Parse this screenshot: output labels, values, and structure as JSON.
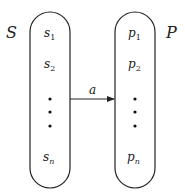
{
  "diagram": {
    "left_set": {
      "label": "S",
      "items": [
        {
          "base": "s",
          "sub": "1"
        },
        {
          "base": "s",
          "sub": "2"
        },
        {
          "base": "s",
          "sub": "n"
        }
      ]
    },
    "right_set": {
      "label": "P",
      "items": [
        {
          "base": "p",
          "sub": "1"
        },
        {
          "base": "p",
          "sub": "2"
        },
        {
          "base": "p",
          "sub": "n"
        }
      ]
    },
    "arrow": {
      "label": "a",
      "from": "S",
      "to": "P"
    },
    "colors": {
      "stroke": "#222222",
      "background": "#ffffff"
    }
  }
}
